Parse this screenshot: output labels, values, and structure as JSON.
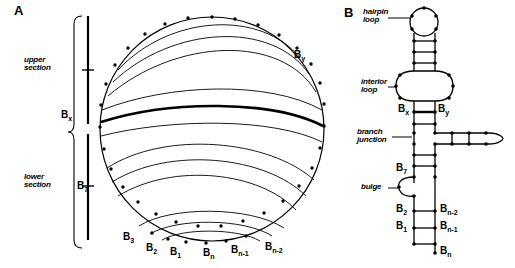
{
  "figure": {
    "panels": [
      {
        "letter": "A",
        "name": "circle-arc-representation",
        "section_labels": [
          {
            "id": "upper",
            "text": "upper\nsection"
          },
          {
            "id": "lower",
            "text": "lower\nsection"
          }
        ],
        "base_labels": [
          {
            "id": "bx",
            "base": "B",
            "sub": "x"
          },
          {
            "id": "by",
            "base": "B",
            "sub": "y"
          },
          {
            "id": "b7",
            "base": "B",
            "sub": "7"
          },
          {
            "id": "b3",
            "base": "B",
            "sub": "3"
          },
          {
            "id": "b2",
            "base": "B",
            "sub": "2"
          },
          {
            "id": "b1",
            "base": "B",
            "sub": "1"
          },
          {
            "id": "bn",
            "base": "B",
            "sub": "n"
          },
          {
            "id": "bn1",
            "base": "B",
            "sub": "n-1"
          },
          {
            "id": "bn2",
            "base": "B",
            "sub": "n-2"
          }
        ]
      },
      {
        "letter": "B",
        "name": "secondary-structure-representation",
        "feature_labels": [
          {
            "id": "hairpin",
            "text": "hairpin\nloop"
          },
          {
            "id": "interior",
            "text": "interior\nloop"
          },
          {
            "id": "branch",
            "text": "branch\njunction"
          },
          {
            "id": "bulge",
            "text": "bulge"
          }
        ],
        "base_labels": [
          {
            "id": "bx",
            "base": "B",
            "sub": "x"
          },
          {
            "id": "by",
            "base": "B",
            "sub": "y"
          },
          {
            "id": "b7",
            "base": "B",
            "sub": "7"
          },
          {
            "id": "b2",
            "base": "B",
            "sub": "2"
          },
          {
            "id": "b1",
            "base": "B",
            "sub": "1"
          },
          {
            "id": "bn2",
            "base": "B",
            "sub": "n-2"
          },
          {
            "id": "bn1",
            "base": "B",
            "sub": "n-1"
          },
          {
            "id": "bn",
            "base": "B",
            "sub": "n"
          }
        ]
      }
    ],
    "colors": {
      "ink": "#000000",
      "background": "#ffffff"
    }
  }
}
